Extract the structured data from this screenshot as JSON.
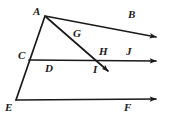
{
  "figure": {
    "background_color": "#ffffff",
    "stroke_color": "#1a1a1a",
    "label_color": "#1a1a1a",
    "width": 173,
    "height": 120,
    "points": {
      "A": {
        "label": "A",
        "x": 45,
        "y": 16,
        "label_x": 33,
        "label_y": 6
      },
      "B": {
        "label": "B",
        "x": 163,
        "y": 38,
        "label_x": 128,
        "label_y": 9
      },
      "C": {
        "label": "C",
        "x": 29,
        "y": 59,
        "label_x": 18,
        "label_y": 50
      },
      "D": {
        "label": "D",
        "x": 58,
        "y": 61,
        "label_x": 45,
        "label_y": 63
      },
      "E": {
        "label": "E",
        "x": 16,
        "y": 100,
        "label_x": 5,
        "label_y": 102
      },
      "F": {
        "label": "F",
        "x": 163,
        "y": 99,
        "label_x": 124,
        "label_y": 102
      },
      "G": {
        "label": "G",
        "x": 80,
        "y": 30,
        "label_x": 73,
        "label_y": 28
      },
      "H": {
        "label": "H",
        "x": 99,
        "y": 61,
        "label_x": 99,
        "label_y": 46
      },
      "I": {
        "label": "I",
        "x": 113,
        "y": 76,
        "label_x": 93,
        "label_y": 64
      },
      "J": {
        "label": "J",
        "x": 130,
        "y": 61,
        "label_x": 126,
        "label_y": 46
      }
    },
    "segments": [
      {
        "name": "segment-a-e",
        "from": "A",
        "to": "E",
        "arrow": false
      },
      {
        "name": "ray-a-b",
        "from": "A",
        "to": "B",
        "arrow": true
      },
      {
        "name": "ray-c-j",
        "from": "C",
        "to": "B",
        "arrow": true
      },
      {
        "name": "ray-e-f",
        "from": "E",
        "to": "F",
        "arrow": true
      },
      {
        "name": "ray-a-i",
        "from": "A",
        "to": "I",
        "arrow": true
      }
    ],
    "labels_order": [
      "A",
      "B",
      "C",
      "D",
      "E",
      "F",
      "G",
      "H",
      "I",
      "J"
    ]
  }
}
